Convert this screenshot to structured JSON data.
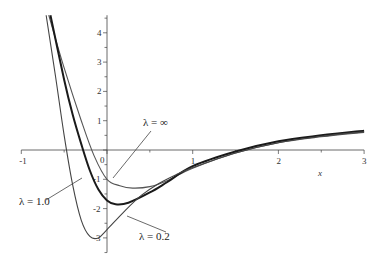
{
  "chart_data": {
    "type": "line",
    "title": "",
    "xlabel": "x",
    "ylabel": "",
    "xlim": [
      -1,
      3
    ],
    "ylim": [
      -3.5,
      4.6
    ],
    "grid": false,
    "x_ticks": [
      "-1",
      "0",
      "1",
      "2",
      "3"
    ],
    "y_ticks": [
      "4",
      "3",
      "2",
      "1",
      "-1",
      "-2",
      "-3"
    ],
    "series": [
      {
        "name": "λ = ∞",
        "stroke": "#555555",
        "width": 1.1,
        "points": [
          [
            -0.68,
            4.6
          ],
          [
            -0.5,
            2.8
          ],
          [
            -0.3,
            1.0
          ],
          [
            -0.15,
            -0.2
          ],
          [
            0,
            -1.0
          ],
          [
            0.15,
            -1.22
          ],
          [
            0.3,
            -1.3
          ],
          [
            0.5,
            -1.25
          ],
          [
            0.7,
            -1.05
          ],
          [
            1.0,
            -0.62
          ],
          [
            1.5,
            -0.1
          ],
          [
            2,
            0.25
          ],
          [
            2.5,
            0.45
          ],
          [
            3,
            0.6
          ]
        ]
      },
      {
        "name": "λ = 1.0",
        "stroke": "#1a1a1a",
        "width": 2.0,
        "points": [
          [
            -0.66,
            4.6
          ],
          [
            -0.5,
            2.4
          ],
          [
            -0.4,
            1.2
          ],
          [
            -0.3,
            0.2
          ],
          [
            -0.2,
            -0.7
          ],
          [
            -0.1,
            -1.35
          ],
          [
            0,
            -1.72
          ],
          [
            0.1,
            -1.85
          ],
          [
            0.25,
            -1.8
          ],
          [
            0.5,
            -1.45
          ],
          [
            0.7,
            -1.1
          ],
          [
            1.0,
            -0.55
          ],
          [
            1.5,
            -0.05
          ],
          [
            2,
            0.3
          ],
          [
            2.5,
            0.5
          ],
          [
            3,
            0.66
          ]
        ]
      },
      {
        "name": "λ = 0.2",
        "stroke": "#444444",
        "width": 1.1,
        "points": [
          [
            -0.71,
            4.6
          ],
          [
            -0.6,
            2.5
          ],
          [
            -0.5,
            0.5
          ],
          [
            -0.4,
            -1.2
          ],
          [
            -0.3,
            -2.4
          ],
          [
            -0.2,
            -2.95
          ],
          [
            -0.1,
            -3.0
          ],
          [
            0,
            -2.72
          ],
          [
            0.2,
            -2.1
          ],
          [
            0.4,
            -1.55
          ],
          [
            0.6,
            -1.15
          ],
          [
            0.8,
            -0.85
          ],
          [
            1.0,
            -0.6
          ],
          [
            1.5,
            -0.1
          ],
          [
            2,
            0.25
          ],
          [
            2.5,
            0.47
          ],
          [
            3,
            0.62
          ]
        ]
      }
    ],
    "annotations": [
      {
        "text": "λ = ∞",
        "x": 143,
        "y": 126,
        "line": [
          151,
          131,
          113,
          178
        ]
      },
      {
        "text": "λ = 1.0",
        "x": 19,
        "y": 205,
        "line": [
          46,
          200,
          82,
          178
        ]
      },
      {
        "text": "λ = 0.2",
        "x": 139,
        "y": 240,
        "line": [
          166,
          232,
          127,
          216
        ]
      }
    ]
  },
  "layout": {
    "x0px": 107,
    "xscale": 85.7,
    "y0px": 150,
    "yscale": 29.3
  }
}
